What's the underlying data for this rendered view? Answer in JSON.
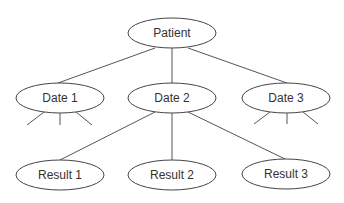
{
  "diagram": {
    "type": "tree",
    "root": {
      "id": "patient",
      "label": "Patient"
    },
    "level1": [
      {
        "id": "date1",
        "label": "Date 1",
        "has_children_stub": true
      },
      {
        "id": "date2",
        "label": "Date 2",
        "has_children_stub": false
      },
      {
        "id": "date3",
        "label": "Date 3",
        "has_children_stub": true
      }
    ],
    "level2": [
      {
        "id": "result1",
        "label": "Result 1",
        "parent": "date2"
      },
      {
        "id": "result2",
        "label": "Result 2",
        "parent": "date2"
      },
      {
        "id": "result3",
        "label": "Result 3",
        "parent": "date2"
      }
    ],
    "edges": [
      [
        "patient",
        "date1"
      ],
      [
        "patient",
        "date2"
      ],
      [
        "patient",
        "date3"
      ],
      [
        "date2",
        "result1"
      ],
      [
        "date2",
        "result2"
      ],
      [
        "date2",
        "result3"
      ]
    ]
  }
}
